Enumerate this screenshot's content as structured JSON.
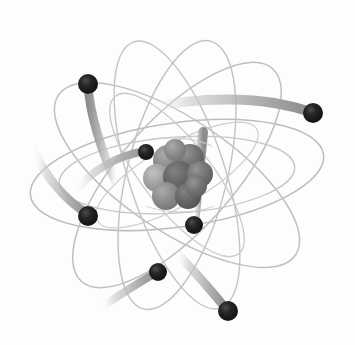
{
  "illustration": {
    "title": "Atom model",
    "subject": "atom",
    "style": "Rutherford-Bohr orbital diagram, scanned clip-art",
    "background_color": "#fdfdfd",
    "canvas": {
      "width": 355,
      "height": 345
    },
    "center": {
      "x": 177,
      "y": 175
    }
  },
  "colors": {
    "background": "#fdfdfd",
    "orbit_line": "#b9b9b9",
    "orbit_line_faint": "#cfcfcf",
    "trail_light": "#cccccc",
    "trail_mid": "#a8a8a8",
    "trail_dark": "#909090",
    "electron_fill": "#1c1c1c",
    "electron_highlight": "#5a5a5a",
    "nucleus_light": "#a6a6a6",
    "nucleus_mid": "#8c8c8c",
    "nucleus_dark": "#6e6e6e",
    "nucleus_darkest": "#5c5c5c"
  },
  "nucleus": {
    "label": "nucleus",
    "particle_count": 9,
    "cluster_center": {
      "x": 177,
      "y": 175
    },
    "particles": [
      {
        "id": "p1",
        "cx": 168,
        "cy": 160,
        "r": 15,
        "shade": "#9b9b9b"
      },
      {
        "id": "p2",
        "cx": 190,
        "cy": 158,
        "r": 14,
        "shade": "#7c7c7c"
      },
      {
        "id": "p3",
        "cx": 157,
        "cy": 178,
        "r": 14,
        "shade": "#666666"
      },
      {
        "id": "p4",
        "cx": 179,
        "cy": 177,
        "r": 16,
        "shade": "#8e8e8e"
      },
      {
        "id": "p5",
        "cx": 200,
        "cy": 174,
        "r": 13,
        "shade": "#6f6f6f"
      },
      {
        "id": "p6",
        "cx": 166,
        "cy": 196,
        "r": 14,
        "shade": "#7a7a7a"
      },
      {
        "id": "p7",
        "cx": 188,
        "cy": 196,
        "r": 13,
        "shade": "#8a8a8a"
      },
      {
        "id": "p8",
        "cx": 196,
        "cy": 186,
        "r": 11,
        "shade": "#636363"
      },
      {
        "id": "p9",
        "cx": 175,
        "cy": 150,
        "r": 11,
        "shade": "#8f8f8f"
      }
    ]
  },
  "orbits": [
    {
      "id": "orbit-1",
      "label": "orbit-horizontal-wide",
      "rx": 148,
      "ry": 52,
      "rotation": -8
    },
    {
      "id": "orbit-2",
      "label": "orbit-tilted-right",
      "rx": 143,
      "ry": 56,
      "rotation": 34
    },
    {
      "id": "orbit-3",
      "label": "orbit-tilted-left",
      "rx": 143,
      "ry": 56,
      "rotation": -48
    },
    {
      "id": "orbit-4",
      "label": "orbit-steep-right",
      "rx": 140,
      "ry": 48,
      "rotation": 72
    },
    {
      "id": "orbit-5",
      "label": "orbit-steep-left",
      "rx": 138,
      "ry": 50,
      "rotation": -76
    },
    {
      "id": "orbit-6",
      "label": "orbit-inner-horizontal",
      "rx": 118,
      "ry": 38,
      "rotation": -4
    },
    {
      "id": "orbit-7",
      "label": "orbit-inner-tilted",
      "rx": 100,
      "ry": 34,
      "rotation": 52
    }
  ],
  "electrons": [
    {
      "id": "e1",
      "label": "electron-upper-left",
      "cx": 88,
      "cy": 84,
      "r": 10
    },
    {
      "id": "e2",
      "label": "electron-upper-right",
      "cx": 313,
      "cy": 113,
      "r": 10
    },
    {
      "id": "e3",
      "label": "electron-inner-upper-left",
      "cx": 146,
      "cy": 152,
      "r": 8
    },
    {
      "id": "e4",
      "label": "electron-left",
      "cx": 88,
      "cy": 216,
      "r": 10
    },
    {
      "id": "e5",
      "label": "electron-inner-lower-right",
      "cx": 194,
      "cy": 225,
      "r": 9
    },
    {
      "id": "e6",
      "label": "electron-lower-left",
      "cx": 158,
      "cy": 272,
      "r": 9
    },
    {
      "id": "e7",
      "label": "electron-lower-right",
      "cx": 228,
      "cy": 311,
      "r": 10
    }
  ],
  "motion_trails": [
    {
      "id": "t1",
      "for_electron": "e1",
      "label": "trail-upper-left",
      "width": 9
    },
    {
      "id": "t2",
      "for_electron": "e2",
      "label": "trail-upper-right",
      "width": 10
    },
    {
      "id": "t3",
      "for_electron": "e3",
      "label": "trail-inner-upper-left",
      "width": 8
    },
    {
      "id": "t4",
      "for_electron": "e4",
      "label": "trail-left",
      "width": 9
    },
    {
      "id": "t5",
      "for_electron": "e5",
      "label": "trail-inner-lower-right",
      "width": 10
    },
    {
      "id": "t6",
      "for_electron": "e6",
      "label": "trail-lower-left",
      "width": 8
    },
    {
      "id": "t7",
      "for_electron": "e7",
      "label": "trail-lower-right",
      "width": 9
    }
  ]
}
